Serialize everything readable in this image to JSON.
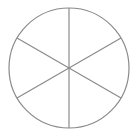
{
  "diagram": {
    "type": "circle-divided-into-sectors",
    "sectors": 6,
    "center": [
      69,
      68
    ],
    "radius": 60,
    "stroke_color": "#8a8a8a",
    "fill_color": "#ffffff"
  }
}
